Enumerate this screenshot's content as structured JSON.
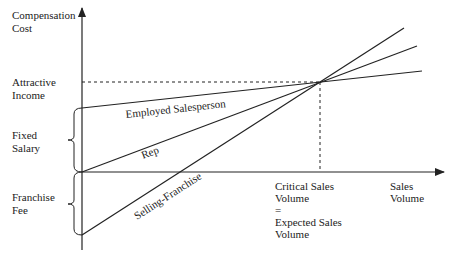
{
  "diagram": {
    "y_axis_label": [
      "Compensation",
      "Cost"
    ],
    "x_axis_label": [
      "Sales",
      "Volume"
    ],
    "left_labels": {
      "attractive_income": [
        "Attractive",
        "Income"
      ],
      "fixed_salary": [
        "Fixed",
        "Salary"
      ],
      "franchise_fee": [
        "Franchise",
        "Fee"
      ]
    },
    "critical_label": [
      "Critical Sales",
      "Volume",
      "=",
      "Expected Sales",
      "Volume"
    ],
    "lines": [
      {
        "name": "Employed Salesperson",
        "label": "Employed Salesperson"
      },
      {
        "name": "Rep",
        "label": "Rep"
      },
      {
        "name": "Selling-Franchise",
        "label": "Selling-Franchise"
      }
    ],
    "colors": {
      "line": "#222222",
      "background": "#ffffff"
    }
  }
}
